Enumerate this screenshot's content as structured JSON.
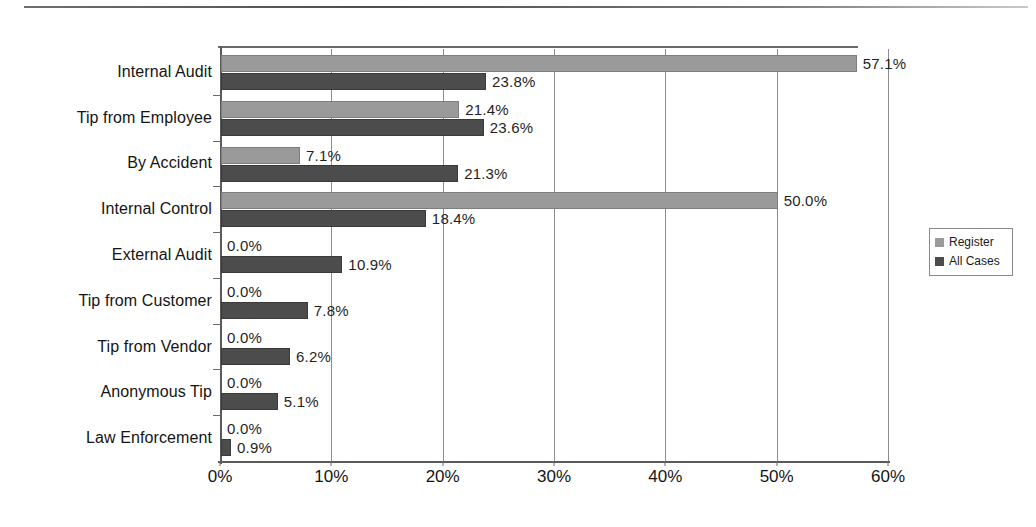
{
  "chart_data": {
    "type": "bar",
    "orientation": "horizontal",
    "title": "",
    "subtitle": "",
    "xlabel": "",
    "ylabel": "",
    "xlim": [
      0,
      60
    ],
    "xtick_labels": [
      "0%",
      "10%",
      "20%",
      "30%",
      "40%",
      "50%",
      "60%"
    ],
    "xtick_values": [
      0,
      10,
      20,
      30,
      40,
      50,
      60
    ],
    "grid": true,
    "grid_axis": "x",
    "legend_position": "right",
    "categories": [
      "Internal Audit",
      "Tip from Employee",
      "By Accident",
      "Internal Control",
      "External Audit",
      "Tip from Customer",
      "Tip from Vendor",
      "Anonymous Tip",
      "Law Enforcement"
    ],
    "series": [
      {
        "name": "Register",
        "color": "#9a9a9a",
        "values": [
          57.1,
          21.4,
          7.1,
          50.0,
          0.0,
          0.0,
          0.0,
          0.0,
          0.0
        ],
        "labels": [
          "57.1%",
          "21.4%",
          "7.1%",
          "50.0%",
          "0.0%",
          "0.0%",
          "0.0%",
          "0.0%",
          "0.0%"
        ]
      },
      {
        "name": "All Cases",
        "color": "#4c4c4c",
        "values": [
          23.8,
          23.6,
          21.3,
          18.4,
          10.9,
          7.8,
          6.2,
          5.1,
          0.9
        ],
        "labels": [
          "23.8%",
          "23.6%",
          "21.3%",
          "18.4%",
          "10.9%",
          "7.8%",
          "6.2%",
          "5.1%",
          "0.9%"
        ]
      }
    ]
  },
  "legend": {
    "items": [
      {
        "label": "Register",
        "color": "#9a9a9a"
      },
      {
        "label": "All Cases",
        "color": "#4c4c4c"
      }
    ]
  }
}
